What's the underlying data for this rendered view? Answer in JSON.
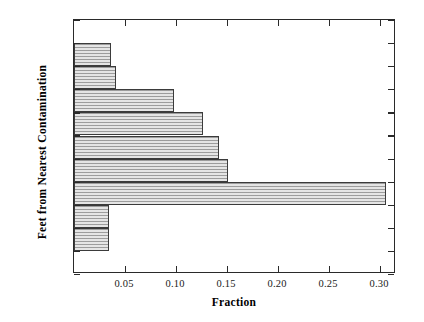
{
  "chart_data": {
    "type": "bar",
    "orientation": "horizontal",
    "title": "",
    "xlabel": "Fraction",
    "ylabel": "Feet from Nearest Contamination",
    "categories": [
      ">5120",
      "2560-5120",
      "1280-2560",
      "640-1280",
      "320-640",
      "160-320",
      "80-160",
      "40-80",
      "20-40",
      "10-20",
      "<10"
    ],
    "values": [
      0.0,
      0.036,
      0.041,
      0.098,
      0.126,
      0.142,
      0.151,
      0.306,
      0.034,
      0.034,
      0.0
    ],
    "xlim": [
      0.0,
      0.3155
    ],
    "xticks": [
      0.05,
      0.1,
      0.15,
      0.2,
      0.25,
      0.3
    ],
    "xtick_labels": [
      "0.05",
      "0.10",
      "0.15",
      "0.20",
      "0.25",
      "0.30"
    ],
    "grid": false,
    "legend": false,
    "bar_fill_color": "#c9c9c9",
    "bar_edge_color": "#3b3b3b",
    "axis_color": "#2a2a2a",
    "background_color": "#ffffff",
    "ticks_all_sides": true
  }
}
